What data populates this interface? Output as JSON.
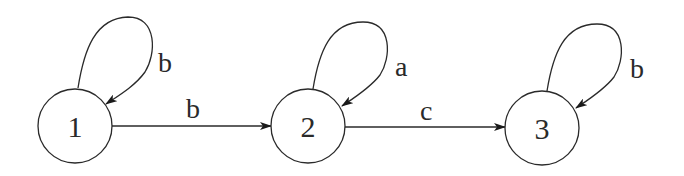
{
  "diagram": {
    "type": "state-transition-graph",
    "colors": {
      "stroke": "#2a2a2a",
      "background": "#ffffff"
    },
    "nodes": [
      {
        "id": "1",
        "label": "1",
        "cx": 75,
        "cy": 126,
        "r": 37
      },
      {
        "id": "2",
        "label": "2",
        "cx": 308,
        "cy": 126,
        "r": 37
      },
      {
        "id": "3",
        "label": "3",
        "cx": 542,
        "cy": 128,
        "r": 37
      }
    ],
    "edges": [
      {
        "from": "1",
        "to": "1",
        "label": "b",
        "kind": "self-loop"
      },
      {
        "from": "1",
        "to": "2",
        "label": "b",
        "kind": "straight"
      },
      {
        "from": "2",
        "to": "2",
        "label": "a",
        "kind": "self-loop"
      },
      {
        "from": "2",
        "to": "3",
        "label": "c",
        "kind": "straight"
      },
      {
        "from": "3",
        "to": "3",
        "label": "b",
        "kind": "self-loop"
      }
    ]
  }
}
